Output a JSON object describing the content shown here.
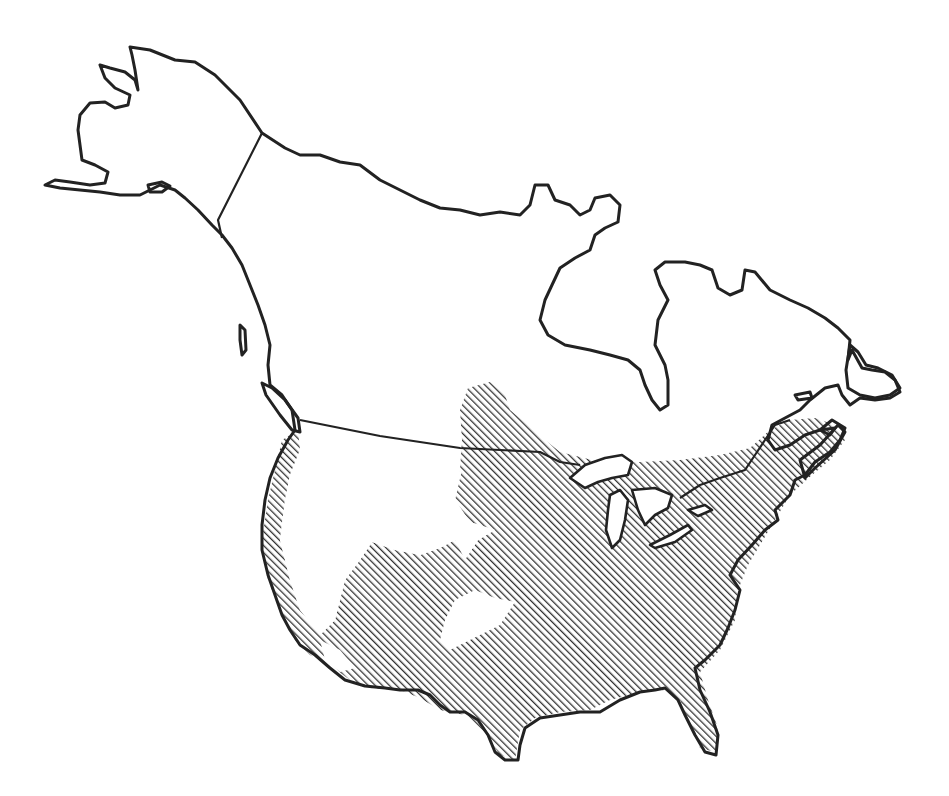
{
  "map": {
    "type": "range-map",
    "region": "North America",
    "style": "black outline, diagonal hatching",
    "colors": {
      "background": "#ffffff",
      "outline": "#222222",
      "hatch": "#333333"
    },
    "legend": null,
    "labels": [],
    "features": [
      {
        "name": "Alaska",
        "shaded": false
      },
      {
        "name": "Canada",
        "shaded": "southern portion only (south-central prairies, Ontario/Quebec south, Maritimes)"
      },
      {
        "name": "Contiguous United States",
        "shaded": "most of area except Great Basin / interior west and small southwest pockets"
      },
      {
        "name": "Great Lakes",
        "shaded": false
      },
      {
        "name": "Hudson Bay",
        "shaded": false
      }
    ],
    "range_description": "Hatched range covers eastern and central United States, Pacific coast strip, southern Rockies/Southwest, southern Canada east of the prairies, and the Maritimes; excludes Great Basin, northern Rockies interior, and northern Canada/Alaska."
  }
}
